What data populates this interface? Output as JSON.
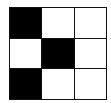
{
  "grid": {
    "rows": 3,
    "cols": 3,
    "cells": [
      [
        1,
        0,
        0
      ],
      [
        0,
        1,
        0
      ],
      [
        1,
        0,
        0
      ]
    ],
    "colors": {
      "filled": "#000000",
      "empty": "#ffffff",
      "line": "#111111"
    }
  }
}
